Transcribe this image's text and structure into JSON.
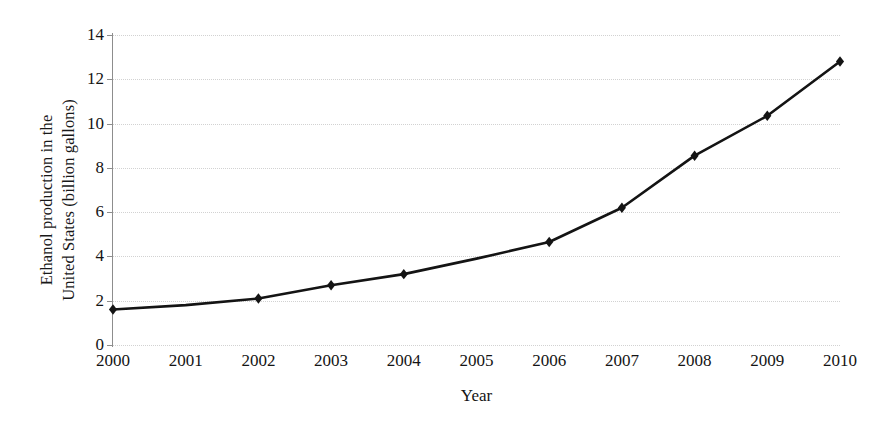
{
  "chart_data": {
    "type": "line",
    "title": "",
    "subtitle": "",
    "xlabel": "Year",
    "ylabel": "Ethanol production in the United States (billion gallons)",
    "ylabel_lines": [
      "Ethanol production in the",
      "United States (billion gallons)"
    ],
    "x": [
      2000,
      2001,
      2002,
      2003,
      2004,
      2005,
      2006,
      2007,
      2008,
      2009,
      2010
    ],
    "categories": [
      "2000",
      "2001",
      "2002",
      "2003",
      "2004",
      "2005",
      "2006",
      "2007",
      "2008",
      "2009",
      "2010"
    ],
    "values": [
      1.6,
      1.8,
      2.1,
      2.7,
      3.2,
      3.9,
      4.65,
      6.2,
      8.55,
      10.35,
      12.8
    ],
    "marker_years": [
      2000,
      2002,
      2003,
      2004,
      2006,
      2007,
      2008,
      2009,
      2010
    ],
    "series": [
      {
        "name": "Ethanol production",
        "values": [
          1.6,
          1.8,
          2.1,
          2.7,
          3.2,
          3.9,
          4.65,
          6.2,
          8.55,
          10.35,
          12.8
        ]
      }
    ],
    "xlim": [
      2000,
      2010
    ],
    "ylim": [
      0,
      14
    ],
    "ytick_labels": [
      "0",
      "2",
      "4",
      "6",
      "8",
      "10",
      "12",
      "14"
    ],
    "yticks": [
      0,
      2,
      4,
      6,
      8,
      10,
      12,
      14
    ],
    "xtick_labels": [
      "2000",
      "2001",
      "2002",
      "2003",
      "2004",
      "2005",
      "2006",
      "2007",
      "2008",
      "2009",
      "2010"
    ],
    "grid": "horizontal",
    "legend": "none",
    "line_color": "#141414",
    "marker_shape": "diamond",
    "marker_color": "#141414",
    "grid_color": "#d2d2d2",
    "axis_color": "#8d8d8d",
    "background_color": "#ffffff"
  }
}
